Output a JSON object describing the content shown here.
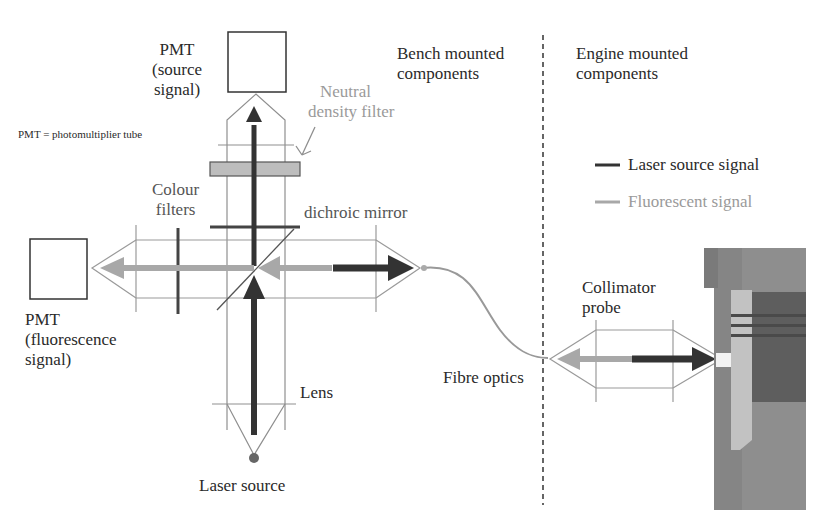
{
  "diagram": {
    "type": "optical-setup-schematic",
    "colors": {
      "laser_signal": "#333333",
      "fluorescent_signal": "#a8a8a8",
      "lens_outline": "#9a9a9a",
      "filter_fill": "#bdbdbd",
      "engine_metal": "#7d7d7d",
      "piston": "#b8b8b8",
      "divider": "#333333"
    },
    "regions": {
      "bench": {
        "line1": "Bench mounted",
        "line2": "components"
      },
      "engine": {
        "line1": "Engine mounted",
        "line2": "components"
      }
    },
    "labels": {
      "pmt_source": {
        "line1": "PMT",
        "line2": "(source",
        "line3": "signal)"
      },
      "pmt_fluorescence": {
        "line1": "PMT",
        "line2": "(fluorescence",
        "line3": "signal)"
      },
      "pmt_definition": "PMT = photomultiplier tube",
      "neutral_density_filter": {
        "line1": "Neutral",
        "line2": "density filter"
      },
      "colour_filters": {
        "line1": "Colour",
        "line2": "filters"
      },
      "dichroic_mirror": "dichroic mirror",
      "lens": "Lens",
      "laser_source": "Laser source",
      "fibre_optics": "Fibre optics",
      "collimator_probe": {
        "line1": "Collimator",
        "line2": "probe"
      }
    },
    "legend": [
      {
        "label": "Laser source signal",
        "color": "#333333"
      },
      {
        "label": "Fluorescent signal",
        "color": "#a8a8a8"
      }
    ]
  }
}
